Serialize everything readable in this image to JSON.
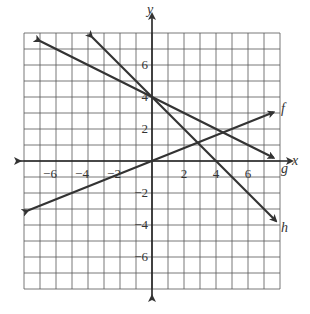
{
  "chart_data": {
    "type": "line",
    "title": "",
    "xlabel": "x",
    "ylabel": "y",
    "xlim": [
      -8,
      8
    ],
    "ylim": [
      -8,
      8
    ],
    "grid": true,
    "x_ticks": [
      "-6",
      "-4",
      "-2",
      "2",
      "4",
      "6"
    ],
    "y_ticks": [
      "6",
      "4",
      "2",
      "-2",
      "-4",
      "-6"
    ],
    "series": [
      {
        "name": "f",
        "equation": "y = 0.4x",
        "points": [
          [
            -7.75,
            -3.1
          ],
          [
            7.6,
            3.05
          ]
        ]
      },
      {
        "name": "g",
        "equation": "y = -0.5x + 4",
        "points": [
          [
            -7.0,
            7.5
          ],
          [
            7.6,
            0.2
          ]
        ]
      },
      {
        "name": "h",
        "equation": "y = -x + 4",
        "points": [
          [
            -3.75,
            7.75
          ],
          [
            7.75,
            -3.75
          ]
        ]
      }
    ]
  },
  "labels": {
    "x_axis": "x",
    "y_axis": "y",
    "f": "f",
    "g": "g",
    "h": "h"
  },
  "ticks": {
    "x": [
      "−6",
      "−4",
      "−2",
      "2",
      "4",
      "6"
    ],
    "y": [
      "6",
      "4",
      "2",
      "−2",
      "−4",
      "−6"
    ]
  },
  "colors": {
    "line": "#333333",
    "grid": "#555555"
  }
}
